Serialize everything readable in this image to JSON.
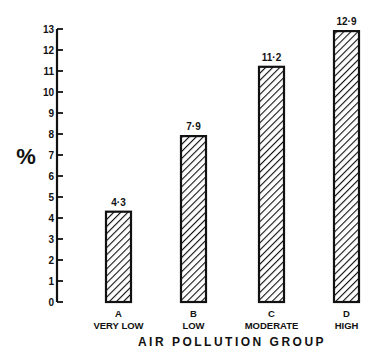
{
  "chart_data": {
    "type": "bar",
    "title": "",
    "xlabel": "AIR  POLLUTION  GROUP",
    "ylabel": "%",
    "ylim": [
      0,
      13
    ],
    "yticks": [
      0,
      1,
      2,
      3,
      4,
      5,
      6,
      7,
      8,
      9,
      10,
      11,
      12,
      13
    ],
    "grid": false,
    "legend": null,
    "categories": [
      "A",
      "B",
      "C",
      "D"
    ],
    "category_sublabels": [
      "VERY LOW",
      "LOW",
      "MODERATE",
      "HIGH"
    ],
    "values": [
      4.3,
      7.9,
      11.2,
      12.9
    ],
    "data_labels": [
      "4·3",
      "7·9",
      "11·2",
      "12·9"
    ],
    "bar_fill": "diagonal-hatch",
    "colors": {
      "ink": "#111111",
      "background": "#ffffff"
    }
  }
}
